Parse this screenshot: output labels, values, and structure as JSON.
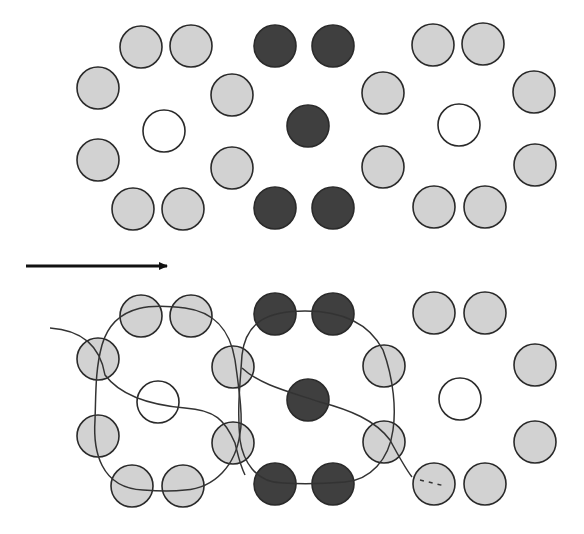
{
  "figure": {
    "colors": {
      "background": "#ffffff",
      "light_fill": "#d2d2d2",
      "dark_fill": "#3f3f3f",
      "empty_fill": "#ffffff",
      "stroke": "#2a2a2a",
      "curve": "#333333",
      "arrow": "#111111"
    },
    "radius": 21,
    "arrow": {
      "x1": 26,
      "y1": 266,
      "x2": 175,
      "y2": 266,
      "label": ""
    },
    "top_panel": {
      "particles": [
        {
          "x": 141,
          "y": 47,
          "type": "light"
        },
        {
          "x": 191,
          "y": 46,
          "type": "light"
        },
        {
          "x": 98,
          "y": 88,
          "type": "light"
        },
        {
          "x": 164,
          "y": 131,
          "type": "empty"
        },
        {
          "x": 98,
          "y": 160,
          "type": "light"
        },
        {
          "x": 133,
          "y": 209,
          "type": "light"
        },
        {
          "x": 183,
          "y": 209,
          "type": "light"
        },
        {
          "x": 232,
          "y": 95,
          "type": "light"
        },
        {
          "x": 232,
          "y": 168,
          "type": "light"
        },
        {
          "x": 275,
          "y": 46,
          "type": "dark"
        },
        {
          "x": 333,
          "y": 46,
          "type": "dark"
        },
        {
          "x": 308,
          "y": 126,
          "type": "dark"
        },
        {
          "x": 275,
          "y": 208,
          "type": "dark"
        },
        {
          "x": 333,
          "y": 208,
          "type": "dark"
        },
        {
          "x": 383,
          "y": 93,
          "type": "light"
        },
        {
          "x": 383,
          "y": 167,
          "type": "light"
        },
        {
          "x": 433,
          "y": 45,
          "type": "light"
        },
        {
          "x": 483,
          "y": 44,
          "type": "light"
        },
        {
          "x": 459,
          "y": 125,
          "type": "empty"
        },
        {
          "x": 534,
          "y": 92,
          "type": "light"
        },
        {
          "x": 535,
          "y": 165,
          "type": "light"
        },
        {
          "x": 434,
          "y": 207,
          "type": "light"
        },
        {
          "x": 485,
          "y": 207,
          "type": "light"
        }
      ]
    },
    "bottom_panel": {
      "particles": [
        {
          "x": 141,
          "y": 316,
          "type": "light"
        },
        {
          "x": 191,
          "y": 316,
          "type": "light"
        },
        {
          "x": 98,
          "y": 359,
          "type": "light"
        },
        {
          "x": 158,
          "y": 402,
          "type": "empty"
        },
        {
          "x": 98,
          "y": 436,
          "type": "light"
        },
        {
          "x": 132,
          "y": 486,
          "type": "light"
        },
        {
          "x": 183,
          "y": 486,
          "type": "light"
        },
        {
          "x": 233,
          "y": 367,
          "type": "light"
        },
        {
          "x": 233,
          "y": 443,
          "type": "light"
        },
        {
          "x": 275,
          "y": 314,
          "type": "dark"
        },
        {
          "x": 333,
          "y": 314,
          "type": "dark"
        },
        {
          "x": 308,
          "y": 400,
          "type": "dark"
        },
        {
          "x": 275,
          "y": 484,
          "type": "dark"
        },
        {
          "x": 333,
          "y": 484,
          "type": "dark"
        },
        {
          "x": 384,
          "y": 366,
          "type": "light"
        },
        {
          "x": 384,
          "y": 442,
          "type": "light"
        },
        {
          "x": 434,
          "y": 313,
          "type": "light"
        },
        {
          "x": 485,
          "y": 313,
          "type": "light"
        },
        {
          "x": 460,
          "y": 399,
          "type": "empty"
        },
        {
          "x": 535,
          "y": 365,
          "type": "light"
        },
        {
          "x": 535,
          "y": 442,
          "type": "light"
        },
        {
          "x": 434,
          "y": 484,
          "type": "light"
        },
        {
          "x": 485,
          "y": 484,
          "type": "light"
        }
      ],
      "curves": [
        {
          "name": "left-loop",
          "d": "M 143 490 C 100 488 93 450 95 420 C 96 395 95 370 102 345 C 115 300 160 305 185 308 C 215 312 230 330 235 360 C 240 395 243 420 240 433 C 236 465 215 488 185 490 C 170 492 155 491 143 490 Z"
        },
        {
          "name": "right-loop",
          "d": "M 283 483 C 255 483 243 460 240 440 C 237 410 240 385 242 355 C 246 320 270 311 305 311 C 345 311 370 325 383 350 C 394 380 396 410 393 430 C 389 460 370 480 345 482 C 320 484 300 484 283 483 Z"
        },
        {
          "name": "left-crossing-strand",
          "d": "M 50 328 C 80 330 100 345 105 375 C 120 395 150 405 185 408 C 215 410 225 420 235 443 C 238 455 240 465 245 475"
        },
        {
          "name": "right-crossing-strand",
          "d": "M 242 368 C 260 385 290 392 320 402 C 350 410 375 420 390 440 C 398 455 405 468 412 477"
        },
        {
          "name": "dashed-tail",
          "d": "M 420 480 L 445 486",
          "dashed": true
        }
      ]
    }
  }
}
